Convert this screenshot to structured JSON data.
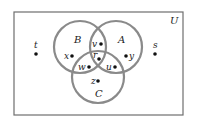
{
  "diagram": {
    "type": "venn",
    "universe": {
      "label": "U",
      "rect": [
        14,
        12,
        169,
        103
      ]
    },
    "sets": [
      {
        "label": "A",
        "cx": 116,
        "cy": 47,
        "r": 26,
        "label_pos": [
          118,
          43
        ]
      },
      {
        "label": "B",
        "cx": 80,
        "cy": 47,
        "r": 26,
        "label_pos": [
          74,
          43
        ]
      },
      {
        "label": "C",
        "cx": 98,
        "cy": 77,
        "r": 26,
        "label_pos": [
          95,
          97
        ]
      }
    ],
    "points": [
      {
        "label": "t",
        "x": 36,
        "y": 54,
        "lx": 34,
        "ly": 48,
        "region": "outside"
      },
      {
        "label": "s",
        "x": 155,
        "y": 54,
        "lx": 153,
        "ly": 48,
        "region": "outside"
      },
      {
        "label": "x",
        "x": 72,
        "y": 56,
        "lx": 64,
        "ly": 59,
        "region": "B only"
      },
      {
        "label": "y",
        "x": 126,
        "y": 56,
        "lx": 129,
        "ly": 59,
        "region": "A only"
      },
      {
        "label": "v",
        "x": 101,
        "y": 44,
        "lx": 92,
        "ly": 47,
        "region": "A and B only"
      },
      {
        "label": "r",
        "x": 99,
        "y": 59,
        "lx": 93,
        "ly": 58,
        "region": "A, B and C"
      },
      {
        "label": "w",
        "x": 89,
        "y": 67,
        "lx": 78,
        "ly": 70,
        "region": "B and C only"
      },
      {
        "label": "u",
        "x": 115,
        "y": 67,
        "lx": 106,
        "ly": 70,
        "region": "A and C only"
      },
      {
        "label": "z",
        "x": 98,
        "y": 81,
        "lx": 91,
        "ly": 84,
        "region": "C only"
      }
    ],
    "colors": {
      "circle_stroke": "#8a8a8a",
      "rect_stroke": "#6e6e6e",
      "point": "#111111"
    }
  }
}
